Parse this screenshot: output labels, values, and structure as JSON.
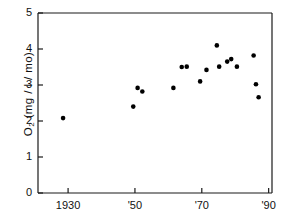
{
  "chart_data": {
    "type": "scatter",
    "title": "",
    "xlabel": "",
    "ylabel": "O2 (mg / l / mo)",
    "ylabel_parts": {
      "prefix": "O",
      "sub": "2",
      "suffix": " (mg / l / mo)"
    },
    "xlim": [
      1921,
      1991
    ],
    "ylim": [
      0,
      5
    ],
    "grid": false,
    "legend": null,
    "yticks": [
      0,
      1,
      2,
      3,
      4,
      5
    ],
    "ytick_labels": [
      "0",
      "1",
      "2",
      "3",
      "4",
      "5"
    ],
    "xticks": [
      1930,
      1950,
      1970,
      1990
    ],
    "xtick_labels": [
      "1930",
      "'50",
      "'70",
      "'90"
    ],
    "marker": "filled-circle",
    "marker_color": "#000000",
    "marker_size_px": 4.4,
    "points": [
      {
        "x": 1928.5,
        "y": 2.08
      },
      {
        "x": 1949.5,
        "y": 2.4
      },
      {
        "x": 1950.8,
        "y": 2.92
      },
      {
        "x": 1952.2,
        "y": 2.82
      },
      {
        "x": 1961.5,
        "y": 2.92
      },
      {
        "x": 1964.0,
        "y": 3.5
      },
      {
        "x": 1965.5,
        "y": 3.51
      },
      {
        "x": 1969.5,
        "y": 3.1
      },
      {
        "x": 1971.4,
        "y": 3.42
      },
      {
        "x": 1974.5,
        "y": 4.1
      },
      {
        "x": 1975.2,
        "y": 3.51
      },
      {
        "x": 1977.6,
        "y": 3.65
      },
      {
        "x": 1978.8,
        "y": 3.72
      },
      {
        "x": 1980.5,
        "y": 3.51
      },
      {
        "x": 1985.5,
        "y": 3.82
      },
      {
        "x": 1986.2,
        "y": 3.02
      },
      {
        "x": 1987.0,
        "y": 2.66
      }
    ]
  },
  "axes": {
    "frame_color": "#1a1a1a",
    "tick_color": "#1a1a1a"
  }
}
